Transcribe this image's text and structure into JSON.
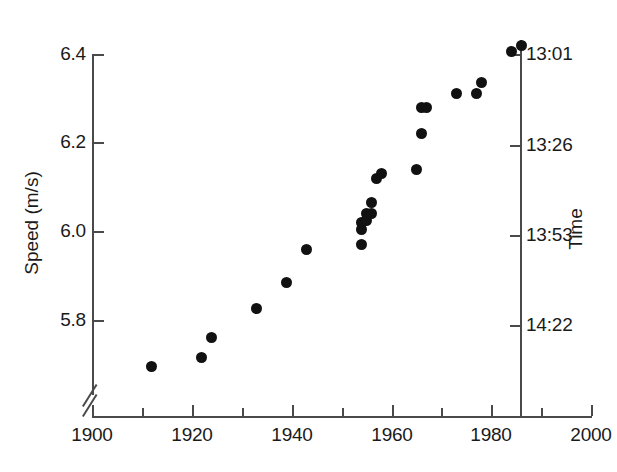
{
  "chart_data": {
    "type": "scatter",
    "title": "",
    "xlabel": "",
    "ylabel": "Speed (m/s)",
    "y2label": "Time",
    "xlim": [
      1900,
      2000
    ],
    "ylim": [
      5.69,
      6.45
    ],
    "grid": false,
    "legend": null,
    "marker": "filled-circle",
    "marker_color": "#111111",
    "x_ticks": [
      1900,
      1920,
      1940,
      1960,
      1980,
      2000
    ],
    "x_tick_labels": [
      "1900",
      "1920",
      "1940",
      "1960",
      "1980",
      "2000"
    ],
    "x_minor_ticks": [
      1910,
      1930,
      1950,
      1970,
      1990
    ],
    "y_ticks": [
      5.8,
      6.0,
      6.2,
      6.4
    ],
    "y_tick_labels": [
      "5.8",
      "6.0",
      "6.2",
      "6.4"
    ],
    "y2_ticks": [
      5.8,
      6.0,
      6.2,
      6.4
    ],
    "y2_tick_labels": [
      "14:22",
      "13:53",
      "13:26",
      "13:01"
    ],
    "axis_break": "y-axis break below 5.8",
    "x": [
      1912,
      1922,
      1924,
      1933,
      1939,
      1943,
      1954,
      1954,
      1954,
      1955,
      1955,
      1956,
      1956,
      1957,
      1958,
      1965,
      1966,
      1966,
      1967,
      1973,
      1977,
      1978,
      1984,
      1986
    ],
    "y": [
      5.695,
      5.715,
      5.76,
      5.825,
      5.885,
      5.96,
      5.97,
      6.005,
      6.02,
      6.025,
      6.04,
      6.04,
      6.065,
      6.12,
      6.13,
      6.14,
      6.22,
      6.28,
      6.28,
      6.31,
      6.31,
      6.335,
      6.405,
      6.42
    ],
    "points": [
      {
        "x": 1912,
        "y": 5.695,
        "time": "14:53"
      },
      {
        "x": 1922,
        "y": 5.715,
        "time": "14:50"
      },
      {
        "x": 1924,
        "y": 5.76,
        "time": "14:43"
      },
      {
        "x": 1933,
        "y": 5.825,
        "time": "14:33"
      },
      {
        "x": 1939,
        "y": 5.885,
        "time": "14:24"
      },
      {
        "x": 1943,
        "y": 5.96,
        "time": "14:13"
      },
      {
        "x": 1954,
        "y": 5.97,
        "time": "14:12"
      },
      {
        "x": 1954,
        "y": 6.005,
        "time": "14:07"
      },
      {
        "x": 1954,
        "y": 6.02,
        "time": "14:05"
      },
      {
        "x": 1955,
        "y": 6.025,
        "time": "14:04"
      },
      {
        "x": 1955,
        "y": 6.04,
        "time": "14:02"
      },
      {
        "x": 1956,
        "y": 6.04,
        "time": "14:02"
      },
      {
        "x": 1956,
        "y": 6.065,
        "time": "13:59"
      },
      {
        "x": 1957,
        "y": 6.12,
        "time": "13:51"
      },
      {
        "x": 1958,
        "y": 6.13,
        "time": "13:50"
      },
      {
        "x": 1965,
        "y": 6.14,
        "time": "13:49"
      },
      {
        "x": 1966,
        "y": 6.22,
        "time": "13:38"
      },
      {
        "x": 1966,
        "y": 6.28,
        "time": "13:30"
      },
      {
        "x": 1967,
        "y": 6.28,
        "time": "13:30"
      },
      {
        "x": 1973,
        "y": 6.31,
        "time": "13:27"
      },
      {
        "x": 1977,
        "y": 6.31,
        "time": "13:27"
      },
      {
        "x": 1978,
        "y": 6.335,
        "time": "13:24"
      },
      {
        "x": 1984,
        "y": 6.405,
        "time": "13:15"
      },
      {
        "x": 1986,
        "y": 6.42,
        "time": "13:13"
      }
    ]
  },
  "axes": {
    "y_left": {
      "title": "Speed (m/s)",
      "labels": [
        "6.4",
        "6.2",
        "6.0",
        "5.8"
      ]
    },
    "y_right": {
      "title": "Time",
      "labels": [
        "13:01",
        "13:26",
        "13:53",
        "14:22"
      ]
    },
    "x": {
      "title": "",
      "labels": [
        "1900",
        "1920",
        "1940",
        "1960",
        "1980",
        "2000"
      ]
    }
  },
  "caption": {
    "partial_text": ""
  }
}
